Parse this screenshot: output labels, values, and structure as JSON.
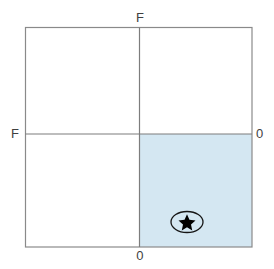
{
  "diagram": {
    "type": "quadrant-plot",
    "title": "",
    "axis_labels": {
      "top": "F",
      "left": "F",
      "right": "0",
      "bottom": "0"
    },
    "colors": {
      "frame_stroke": "#808080",
      "axis_stroke": "#808080",
      "shaded_quadrant_fill": "#d4e7f2",
      "marker_fill": "#000000",
      "marker_outline": "#1a1a1a",
      "label_text": "#3f3f3f",
      "background": "#ffffff"
    },
    "frame": {
      "x": 25,
      "y": 27,
      "width": 227,
      "height": 220
    },
    "axes": {
      "vertical_x": 139,
      "horizontal_y": 134
    },
    "shaded_quadrant": {
      "name": "bottom-right",
      "x": 139,
      "y": 134,
      "width": 113,
      "height": 113
    },
    "marker": {
      "name": "star-in-ellipse",
      "glyph": "star",
      "center_x": 187,
      "center_y": 222,
      "ellipse_rx": 16,
      "ellipse_ry": 11,
      "star_size": 11
    }
  }
}
